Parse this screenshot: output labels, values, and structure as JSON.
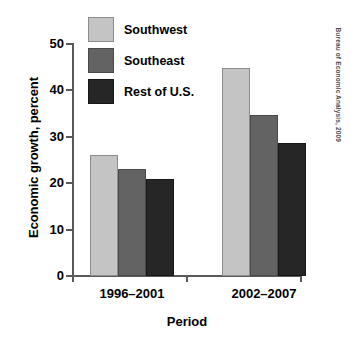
{
  "chart_data": {
    "type": "bar",
    "title": "",
    "xlabel": "Period",
    "ylabel": "Economic growth, percent",
    "categories": [
      "1996–2001",
      "2002–2007"
    ],
    "series": [
      {
        "name": "Southwest",
        "values": [
          26.0,
          44.8
        ],
        "color": "#c4c4c4"
      },
      {
        "name": "Southeast",
        "values": [
          23.0,
          34.7
        ],
        "color": "#636363"
      },
      {
        "name": "Rest of U.S.",
        "values": [
          21.0,
          28.6
        ],
        "color": "#262626"
      }
    ],
    "ylim": [
      0,
      50
    ],
    "yticks": [
      0,
      10,
      20,
      30,
      40,
      50
    ],
    "ytick_labels": [
      "0",
      "10",
      "20",
      "30",
      "40",
      "50"
    ],
    "grid": false,
    "legend_position": "upper-left-inside"
  },
  "source": {
    "credit": "Bureau of Economic Analysis, 2009"
  }
}
